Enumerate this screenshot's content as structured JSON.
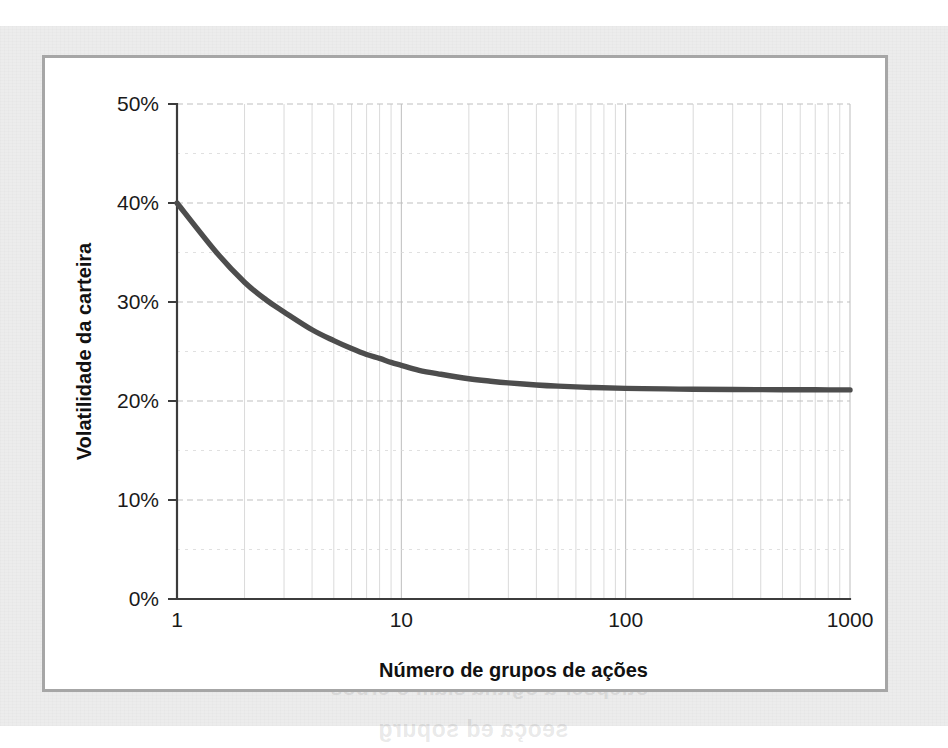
{
  "page": {
    "background_color": "#ececec",
    "panel_background": "#ffffff",
    "panel_border_color": "#a6a6a6",
    "ghost_text_top": "etroc ed sodnuf so erbos açnarepse a ,airomem a",
    "ghost_text_mid": "otiepser a ogitna siam o erbos",
    "ghost_text_bottom": "seoça ed sopurg"
  },
  "chart_data": {
    "type": "line",
    "title": "",
    "subtitle": "",
    "xlabel": "Número de grupos de ações",
    "ylabel": "Volatilidade da carteira",
    "xscale": "log",
    "yscale": "linear",
    "xlim": [
      1,
      1000
    ],
    "ylim": [
      0,
      0.5
    ],
    "grid": true,
    "legend": null,
    "legend_position": "none",
    "line_color": "#4d4d4d",
    "grid_color": "#bdbdbd",
    "axis_color": "#3c3c3c",
    "xticks": [
      1,
      10,
      100,
      1000
    ],
    "xticklabels": [
      "1",
      "10",
      "100",
      "1000"
    ],
    "yticks": [
      0,
      0.1,
      0.2,
      0.3,
      0.4,
      0.5
    ],
    "yticklabels": [
      "0%",
      "10%",
      "20%",
      "30%",
      "40%",
      "50%"
    ],
    "y_minor_ticks": [
      0.05,
      0.15,
      0.25,
      0.35,
      0.45
    ],
    "x_minor_ticks": [
      2,
      3,
      4,
      5,
      6,
      7,
      8,
      9,
      20,
      30,
      40,
      50,
      60,
      70,
      80,
      90,
      200,
      300,
      400,
      500,
      600,
      700,
      800,
      900
    ],
    "series": [
      {
        "name": "Volatilidade da carteira",
        "x": [
          1,
          1.5,
          2,
          2.5,
          3,
          4,
          5,
          6,
          7,
          8,
          9,
          10,
          12,
          15,
          20,
          25,
          30,
          40,
          50,
          70,
          100,
          150,
          200,
          300,
          500,
          700,
          1000
        ],
        "y": [
          0.4,
          0.35,
          0.32,
          0.302,
          0.29,
          0.272,
          0.261,
          0.253,
          0.247,
          0.243,
          0.239,
          0.236,
          0.231,
          0.227,
          0.2225,
          0.22,
          0.2183,
          0.2162,
          0.215,
          0.2137,
          0.2128,
          0.2122,
          0.2119,
          0.2116,
          0.2114,
          0.2113,
          0.2112
        ]
      }
    ],
    "annotations": [
      {
        "text": "Volatilidade inicial de um único grupo",
        "value": "40%"
      },
      {
        "text": "Volatilidade assíntota diversificada",
        "value": "21%"
      }
    ]
  }
}
